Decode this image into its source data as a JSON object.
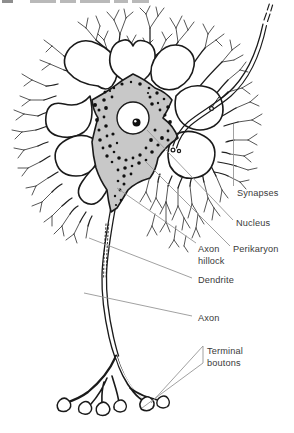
{
  "figure": {
    "labels": {
      "synapses": "Synapses",
      "nucleus": "Nucleus",
      "perikaryon": "Perikaryon",
      "axon_hillock": "Axon hillock",
      "dendrite": "Dendrite",
      "axon": "Axon",
      "terminal_boutons": "Terminal boutons"
    },
    "colors": {
      "ink": "#1a1a1a",
      "soma_fill": "#c8c8c8",
      "leader_line": "#969696",
      "label_text": "#3a3a3a",
      "paper": "#ffffff"
    }
  }
}
